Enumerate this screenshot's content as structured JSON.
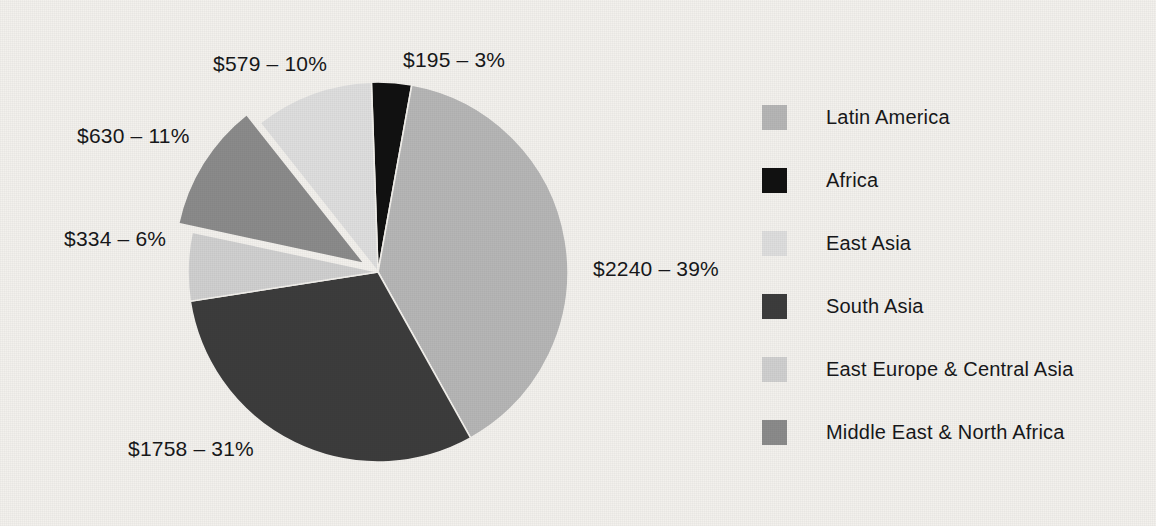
{
  "chart_data": {
    "type": "pie",
    "title": "",
    "subtitle": "",
    "unit": "$ millions",
    "total_value": 5736,
    "legend_position": "right",
    "grid": false,
    "start_angle_deg": -2,
    "categories": [
      "Latin America",
      "Africa",
      "East Asia",
      "South Asia",
      "East Europe & Central Asia",
      "Middle East & North Africa"
    ],
    "values": [
      2240,
      195,
      579,
      1758,
      334,
      630
    ],
    "percents": [
      39,
      3,
      10,
      31,
      6,
      11
    ],
    "colors": [
      "#b6b6b6",
      "#111111",
      "#dedede",
      "#3c3c3c",
      "#d0d0d0",
      "#8b8b8b"
    ],
    "slices": [
      {
        "name": "Africa",
        "value": 195,
        "percent": 3,
        "color": "#111111",
        "label": "$195 – 3%",
        "exploded": false
      },
      {
        "name": "Latin America",
        "value": 2240,
        "percent": 39,
        "color": "#b6b6b6",
        "label": "$2240 – 39%",
        "exploded": false
      },
      {
        "name": "South Asia",
        "value": 1758,
        "percent": 31,
        "color": "#3c3c3c",
        "label": "$1758 – 31%",
        "exploded": false
      },
      {
        "name": "East Europe & Central Asia",
        "value": 334,
        "percent": 6,
        "color": "#d0d0d0",
        "label": "$334 – 6%",
        "exploded": false
      },
      {
        "name": "Middle East & North Africa",
        "value": 630,
        "percent": 11,
        "color": "#8b8b8b",
        "label": "$630 – 11%",
        "exploded": true
      },
      {
        "name": "East Asia",
        "value": 579,
        "percent": 10,
        "color": "#dedede",
        "label": "$579 – 10%",
        "exploded": false
      }
    ]
  },
  "labels": {
    "africa": "$195 – 3%",
    "latin_america": "$2240 – 39%",
    "south_asia": "$1758 – 31%",
    "east_europe": "$334 – 6%",
    "middle_east": "$630 – 11%",
    "east_asia": "$579 – 10%"
  },
  "legend": {
    "items": [
      {
        "label": "Latin America",
        "color": "#b6b6b6"
      },
      {
        "label": "Africa",
        "color": "#111111"
      },
      {
        "label": "East Asia",
        "color": "#dedede"
      },
      {
        "label": "South Asia",
        "color": "#3c3c3c"
      },
      {
        "label": "East Europe & Central Asia",
        "color": "#d0d0d0"
      },
      {
        "label": "Middle East & North Africa",
        "color": "#8b8b8b"
      }
    ]
  },
  "colors": {
    "background": "#f3f1ed",
    "text": "#17181a",
    "slice_outline": "#f3f1ed"
  }
}
